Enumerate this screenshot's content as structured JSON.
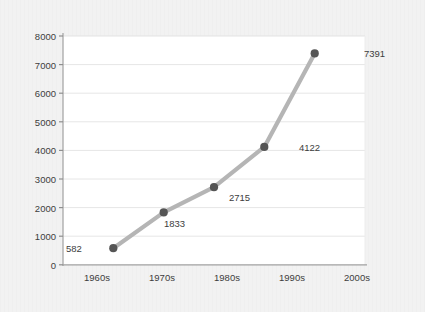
{
  "chart_data": {
    "type": "line",
    "title": "",
    "subtitle": "",
    "xlabel": "",
    "ylabel": "",
    "categories": [
      "1960s",
      "1970s",
      "1980s",
      "1990s",
      "2000s"
    ],
    "values": [
      582,
      1833,
      2715,
      4122,
      7391
    ],
    "point_labels": [
      "582",
      "1833",
      "2715",
      "4122",
      "7391"
    ],
    "series": [
      {
        "name": "",
        "values": [
          582,
          1833,
          2715,
          4122,
          7391
        ]
      }
    ],
    "ylim": [
      0,
      8000
    ],
    "yticks": [
      0,
      1000,
      2000,
      3000,
      4000,
      5000,
      6000,
      7000,
      8000
    ],
    "ytick_labels": [
      "0",
      "1000",
      "2000",
      "3000",
      "4000",
      "5000",
      "6000",
      "7000",
      "8000"
    ],
    "xtick_labels": [
      "1960s",
      "1970s",
      "1980s",
      "1990s",
      "2000s"
    ],
    "grid": true,
    "grid_axis": "y",
    "legend": false,
    "legend_position": "none",
    "markers": true,
    "colors": {
      "line": "#b5b5b5",
      "marker": "#555555",
      "grid": "#e2e2e2",
      "axis": "#9a9a9a",
      "plot_background": "#ffffff",
      "figure_background": "#f2f2f2",
      "text": "#3d3d3d"
    }
  },
  "axes": {
    "y_tick_labels": [
      "8000",
      "7000",
      "6000",
      "5000",
      "4000",
      "3000",
      "2000",
      "1000",
      "0"
    ],
    "x_tick_labels": [
      "1960s",
      "1970s",
      "1980s",
      "1990s",
      "2000s"
    ]
  },
  "point_label_text": {
    "p0": "582",
    "p1": "1833",
    "p2": "2715",
    "p3": "4122",
    "p4": "7391"
  }
}
